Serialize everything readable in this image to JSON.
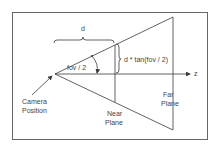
{
  "diagram": {
    "labels": {
      "distance": "d",
      "half_height": "d * tan(fov / 2)",
      "angle": "fov / 2",
      "axis": "z",
      "camera_line1": "Camera",
      "camera_line2": "Position",
      "near_line1": "Near",
      "near_line2": "Plane",
      "far_line1": "Far",
      "far_line2": "Plane"
    },
    "colors": {
      "line": "#3a3a3a",
      "border": "#555555",
      "text": "#444444",
      "background": "#ffffff"
    }
  }
}
